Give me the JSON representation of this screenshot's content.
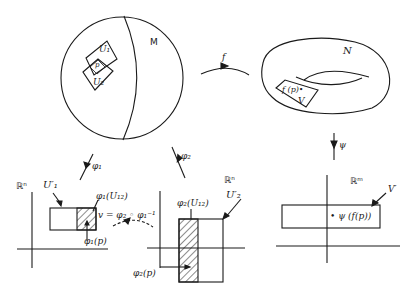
{
  "diagram": {
    "manifold_M": {
      "label": "M",
      "patch_U1": "U₁",
      "patch_U2": "U₂",
      "point": "p"
    },
    "manifold_N": {
      "label": "N",
      "point": "f (p)•",
      "patch_V": "V"
    },
    "maps": {
      "f": "f",
      "phi1": "φ₁",
      "phi2": "φ₂",
      "psi": "ψ",
      "transition": "v = φ₂ ◦ φ₁⁻¹"
    },
    "chart_rn_1": {
      "space": "ℝⁿ",
      "region": "U′₁",
      "overlap": "φ₁(U₁₂)",
      "point": "φ₁(p)"
    },
    "chart_rn_2": {
      "space": "ℝⁿ",
      "region": "U′₂",
      "overlap": "φ₂(U₁₂)",
      "point": "φ₂(p)"
    },
    "chart_rm": {
      "space": "ℝᵐ",
      "region": "V′",
      "point": "• ψ (f(p))"
    }
  },
  "colors": {
    "ink": "#1a1a1a",
    "background": "#ffffff"
  }
}
